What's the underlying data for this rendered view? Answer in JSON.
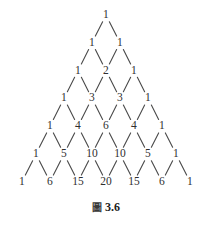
{
  "figure": {
    "caption_glyph": "圖",
    "caption_label": "3.6",
    "caption_full": "圖 3.6"
  },
  "chart_data": {
    "type": "diagram",
    "subtitle": "",
    "xlabel": "",
    "ylabel": "",
    "diagram_kind": "pascal-triangle-lattice",
    "row_count": 7,
    "rows": [
      {
        "index": 0,
        "values": [
          1
        ]
      },
      {
        "index": 1,
        "values": [
          1,
          1
        ]
      },
      {
        "index": 2,
        "values": [
          1,
          2,
          1
        ]
      },
      {
        "index": 3,
        "values": [
          1,
          3,
          3,
          1
        ]
      },
      {
        "index": 4,
        "values": [
          1,
          4,
          6,
          4,
          1
        ]
      },
      {
        "index": 5,
        "values": [
          1,
          5,
          10,
          10,
          5,
          1
        ]
      },
      {
        "index": 6,
        "values": [
          1,
          6,
          15,
          20,
          15,
          6,
          1
        ]
      }
    ],
    "edges_note": "Edges are drawn only between rows 0-1 through 5-6; every value links down-left and down-right.",
    "grid": false,
    "legend": "none",
    "colors": {
      "background": "#ffffff",
      "text": "#2f2f2f",
      "edge": "#4a4a4a"
    },
    "geometry": {
      "apex_x": 106,
      "apex_y": 15,
      "row_step_y": 27.8,
      "half_step_x": 14.0
    }
  }
}
